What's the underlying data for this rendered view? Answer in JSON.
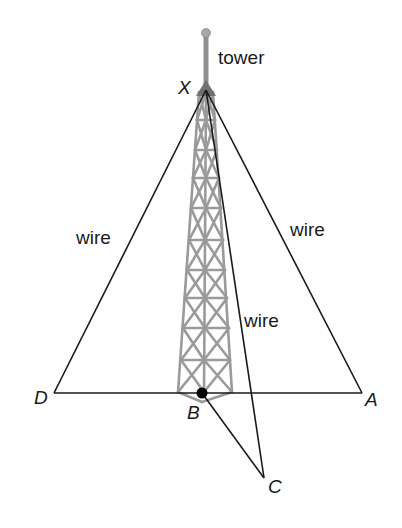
{
  "diagram": {
    "type": "geometry-figure",
    "points": {
      "X": {
        "label": "X",
        "x": 206,
        "y": 90
      },
      "D": {
        "label": "D",
        "x": 54,
        "y": 393
      },
      "A": {
        "label": "A",
        "x": 362,
        "y": 393
      },
      "B": {
        "label": "B",
        "x": 202,
        "y": 393
      },
      "C": {
        "label": "C",
        "x": 264,
        "y": 478
      }
    },
    "labels": {
      "tower": "tower",
      "wire_left": "wire",
      "wire_right": "wire",
      "wire_center": "wire"
    },
    "segments": [
      "XD",
      "XA",
      "DA",
      "XC",
      "BC"
    ],
    "colors": {
      "line": "#1a1a1a",
      "tower": "#9a9a9a",
      "tower_top": "#7a7a7a",
      "point": "#000000"
    }
  }
}
